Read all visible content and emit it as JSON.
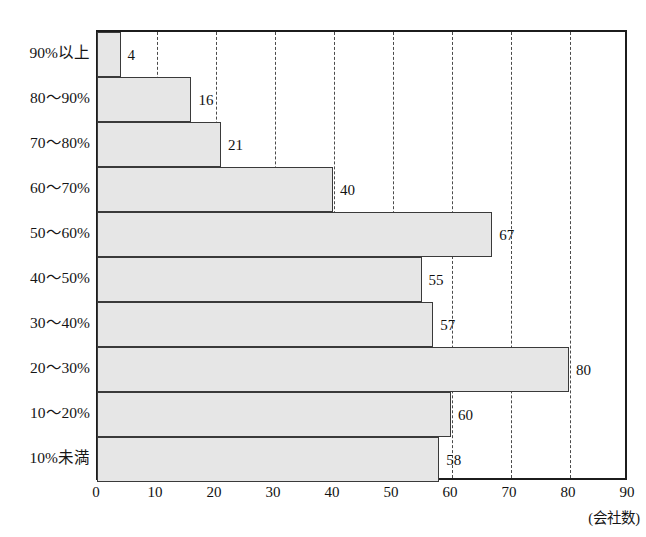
{
  "axis": {
    "unit_label": "(会社数)",
    "x_ticks": [
      0,
      10,
      20,
      30,
      40,
      50,
      60,
      70,
      80,
      90
    ]
  },
  "chart_data": {
    "type": "bar",
    "orientation": "horizontal",
    "xlabel": "(会社数)",
    "ylabel": "",
    "xlim": [
      0,
      90
    ],
    "grid": "vertical-dashed",
    "legend": "none",
    "categories": [
      "90%以上",
      "80～90%",
      "70～80%",
      "60～70%",
      "50～60%",
      "40～50%",
      "30～40%",
      "20～30%",
      "10～20%",
      "10%未満"
    ],
    "values": [
      4,
      16,
      21,
      40,
      67,
      55,
      57,
      80,
      60,
      58
    ],
    "tick_labels": [
      "0",
      "10",
      "20",
      "30",
      "40",
      "50",
      "60",
      "70",
      "80",
      "90"
    ],
    "colors": {
      "bar_fill": "#e6e6e6",
      "bar_border": "#3a3a3a",
      "frame": "#1c1c1c",
      "gridline": "#4a4a4a",
      "text": "#111111"
    }
  }
}
